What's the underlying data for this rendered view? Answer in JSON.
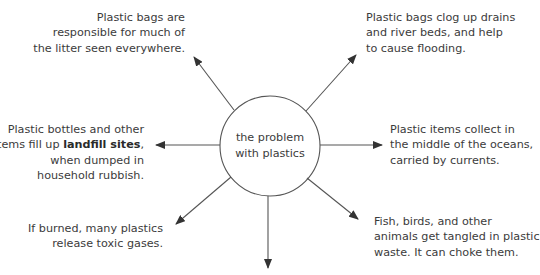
{
  "diagram": {
    "title": "the problem with plastics",
    "center": {
      "lines": [
        "the problem",
        "with plastics"
      ]
    },
    "nodes": [
      {
        "id": "litter",
        "position": "top-left",
        "lines": [
          "Plastic bags are",
          "responsible for much of",
          "the litter seen everywhere."
        ]
      },
      {
        "id": "flooding",
        "position": "top-right",
        "lines": [
          "Plastic bags clog up drains",
          "and river beds, and help",
          "to cause flooding."
        ]
      },
      {
        "id": "landfill",
        "position": "left",
        "lines": [
          "Plastic bottles and other",
          "items fill up ",
          "landfill sites",
          ",",
          "when dumped in",
          "household rubbish."
        ],
        "line1_pre": "Plastic bottles and other",
        "line2_pre": "items fill up ",
        "line2_bold": "landfill sites",
        "line2_post": ",",
        "line3": "when dumped in",
        "line4": "household rubbish."
      },
      {
        "id": "oceans",
        "position": "right",
        "lines": [
          "Plastic items collect in",
          "the middle of the oceans,",
          "carried by currents."
        ]
      },
      {
        "id": "toxic",
        "position": "bottom-left",
        "lines": [
          "If burned, many plastics",
          "release toxic gases."
        ]
      },
      {
        "id": "animals",
        "position": "bottom-right",
        "lines": [
          "Fish, birds, and other",
          "animals get tangled in plastic",
          "waste. It can choke them."
        ]
      },
      {
        "id": "empty",
        "position": "bottom",
        "lines": []
      }
    ],
    "colors": {
      "line": "#555555",
      "text": "#3b3b3b",
      "background": "#ffffff"
    }
  }
}
